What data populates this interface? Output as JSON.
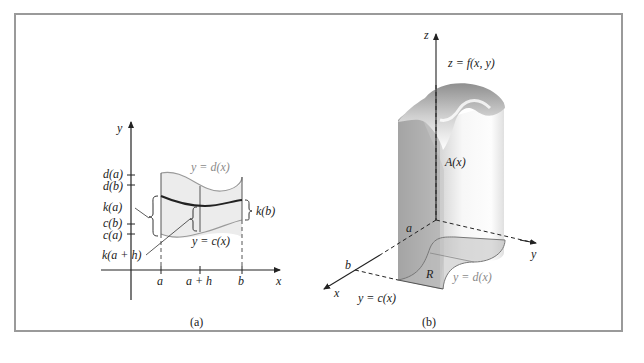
{
  "panel_a": {
    "caption": "(a)",
    "axis_y": "y",
    "axis_x": "x",
    "y_ticks": [
      "d(a)",
      "d(b)",
      "k(a)",
      "c(b)",
      "c(a)"
    ],
    "x_ticks": [
      "a",
      "a + h",
      "b"
    ],
    "curve_upper": "y = d(x)",
    "curve_lower": "y = c(x)",
    "brace_right": "k(b)",
    "pointer_label": "k(a + h)"
  },
  "panel_b": {
    "caption": "(b)",
    "axis_z": "z",
    "axis_y": "y",
    "axis_x": "x",
    "surface_label": "z = f(x, y)",
    "cross_section_label": "A(x)",
    "region_label": "R",
    "x_marks": [
      "a",
      "b"
    ],
    "curve_upper": "y = d(x)",
    "curve_lower": "y = c(x)"
  },
  "colors": {
    "frame": "#9a9a9a",
    "region_fill": "#ececec",
    "solid_dark": "#9c9c9c",
    "solid_light": "#f4f4f4"
  }
}
